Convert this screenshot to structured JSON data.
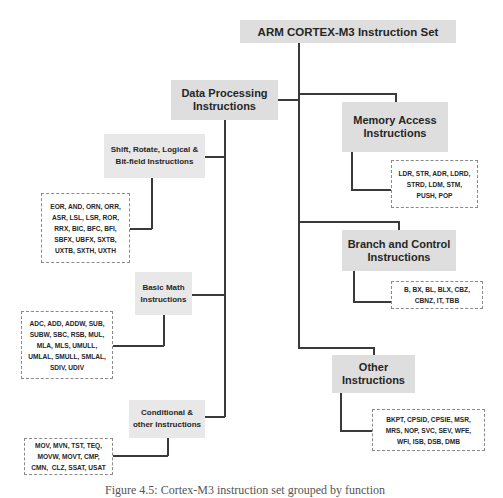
{
  "diagram": {
    "title": "ARM CORTEX-M3 Instruction Set",
    "categories": [
      {
        "label_line1": "Data Processing",
        "label_line2": "Instructions",
        "subcategories": [
          {
            "label_line1": "Shift, Rotate, Logical &",
            "label_line2": "Bit-field Instructions",
            "instructions": [
              "EOR, AND, ORN, ORR,",
              "ASR, LSL, LSR, ROR,",
              "RRX, BIC, BFC, BFI,",
              "SBFX, UBFX, SXTB,",
              "UXTB, SXTH, UXTH"
            ]
          },
          {
            "label_line1": "Basic Math",
            "label_line2": "Instructions",
            "instructions": [
              "ADC, ADD, ADDW, SUB,",
              "SUBW, SBC, RSB, MUL,",
              "MLA, MLS, UMULL,",
              "UMLAL, SMULL, SMLAL,",
              "SDIV, UDIV"
            ]
          },
          {
            "label_line1": "Conditional &",
            "label_line2": "other Instructions",
            "instructions": [
              "MOV, MVN, TST, TEQ,",
              "MOVW, MOVT, CMP,",
              "CMN,  CLZ, SSAT, USAT"
            ]
          }
        ]
      },
      {
        "label_line1": "Memory Access",
        "label_line2": "Instructions",
        "instructions": [
          "LDR, STR, ADR, LDRD,",
          "STRD, LDM, STM,",
          "PUSH, POP"
        ]
      },
      {
        "label_line1": "Branch and Control",
        "label_line2": "Instructions",
        "instructions": [
          "B, BX, BL, BLX, CBZ,",
          "CBNZ, IT, TBB"
        ]
      },
      {
        "label_line1": "Other",
        "label_line2": "Instructions",
        "instructions": [
          "BKPT, CPSID, CPSIE, MSR,",
          "MRS, NOP, SVC, SEV, WFE,",
          "WFI, ISB, DSB, DMB"
        ]
      }
    ],
    "caption": "Figure 4.5: Cortex-M3 instruction set grouped by function"
  }
}
